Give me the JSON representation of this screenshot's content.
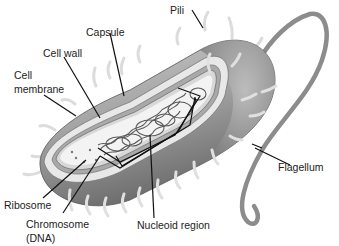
{
  "diagram": {
    "labels": {
      "capsule": "Capsule",
      "pili": "Pili",
      "cell_wall": "Cell wall",
      "cell_membrane_1": "Cell",
      "cell_membrane_2": "membrane",
      "ribosome": "Ribosome",
      "chromosome_1": "Chromosome",
      "chromosome_2": "(DNA)",
      "nucleoid": "Nucleoid region",
      "flagellum": "Flagellum"
    },
    "colors": {
      "body_dark": "#6e6e6e",
      "body_light": "#bdbdbd",
      "capsule": "#e6e6e6",
      "cell_wall": "#a8a8a8",
      "membrane": "#8a8a8a",
      "cytoplasm": "#f2f2f2",
      "dna": "#555555",
      "flagellum": "#8c8c8c",
      "leader": "#111111"
    }
  }
}
